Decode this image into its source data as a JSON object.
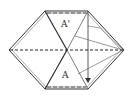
{
  "diagram": {
    "type": "origami-fold-hexagon",
    "labels": {
      "upper": "A'",
      "lower": "A"
    },
    "colors": {
      "stroke": "#2a2a2a",
      "outline_inner": "#888888",
      "background": "#ffffff"
    }
  }
}
